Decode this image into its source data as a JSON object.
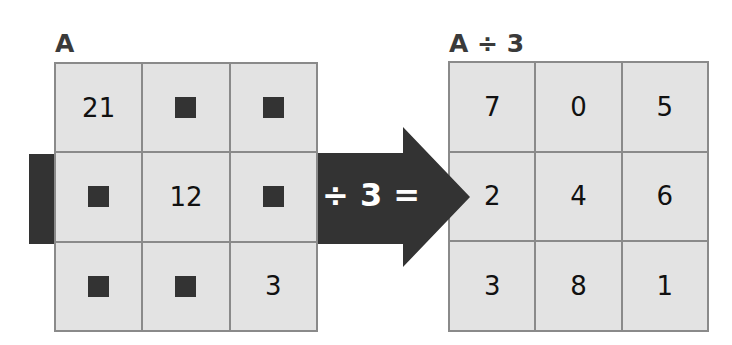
{
  "left": {
    "title": "A",
    "cells": [
      "21",
      "",
      "",
      "",
      "12",
      "",
      "",
      "",
      "3"
    ],
    "blank_flags": [
      false,
      true,
      true,
      true,
      false,
      true,
      true,
      true,
      false
    ]
  },
  "right": {
    "title": "A ÷ 3",
    "cells": [
      "7",
      "0",
      "5",
      "2",
      "4",
      "6",
      "3",
      "8",
      "1"
    ]
  },
  "arrow": {
    "label": "÷ 3 =",
    "color": "#333333"
  },
  "colors": {
    "cell_bg": "#e3e3e3",
    "grid_line": "#8a8a8a",
    "blank_square": "#333333"
  }
}
